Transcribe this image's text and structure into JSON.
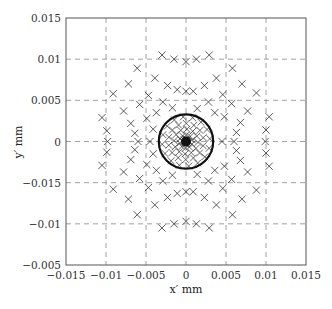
{
  "chart_data": {
    "type": "scatter",
    "title": "",
    "xlabel": "x′ mm",
    "ylabel": "y′ mm",
    "xlim": [
      -0.015,
      0.015
    ],
    "ylim": [
      -0.015,
      0.015
    ],
    "grid": true,
    "legend": null,
    "x_ticks": [
      "−0.015",
      "−0.01",
      "−0.005",
      "0",
      "0.005",
      "0.01",
      "0.015"
    ],
    "y_ticks_top_to_bottom": [
      "0.015",
      "0.01",
      "0.005",
      "0",
      "−0.015",
      "−0.01",
      "−0.005"
    ],
    "marker": "x",
    "colors": {
      "marker": "#333333",
      "grid": "#8a8a8a",
      "axes": "#555555",
      "circle": "#111111"
    },
    "circle": {
      "center": [
        0,
        0
      ],
      "radius": 0.0034,
      "label": ""
    },
    "series": [
      {
        "name": "spot diagram (outer rays, upper half)",
        "points": [
          [
            -0.003,
            0.0105
          ],
          [
            -0.0015,
            0.01
          ],
          [
            0.0,
            0.0097
          ],
          [
            -0.0061,
            0.0089
          ],
          [
            -0.0039,
            0.0077
          ],
          [
            -0.0072,
            0.007
          ],
          [
            -0.0023,
            0.0068
          ],
          [
            -0.0011,
            0.0063
          ],
          [
            0.0,
            0.0061
          ],
          [
            -0.0091,
            0.0058
          ],
          [
            -0.0047,
            0.0056
          ],
          [
            -0.0058,
            0.0045
          ],
          [
            -0.0029,
            0.0048
          ],
          [
            -0.0078,
            0.0037
          ],
          [
            -0.0037,
            0.0035
          ],
          [
            -0.0017,
            0.0041
          ],
          [
            -0.0105,
            0.0029
          ],
          [
            -0.0049,
            0.0028
          ],
          [
            -0.0069,
            0.0022
          ],
          [
            -0.0099,
            0.0013
          ],
          [
            -0.0041,
            0.0015
          ],
          [
            -0.0064,
            0.001
          ],
          [
            -0.0098,
            0.0
          ],
          [
            0.0029,
            0.0105
          ],
          [
            0.0013,
            0.01
          ],
          [
            0.0058,
            0.0089
          ],
          [
            0.0038,
            0.0077
          ],
          [
            0.007,
            0.007
          ],
          [
            0.0023,
            0.0068
          ],
          [
            0.0009,
            0.0061
          ],
          [
            0.0088,
            0.0059
          ],
          [
            0.0046,
            0.0057
          ],
          [
            0.0057,
            0.0046
          ],
          [
            0.0028,
            0.0048
          ],
          [
            0.0014,
            0.004
          ],
          [
            0.0077,
            0.0037
          ],
          [
            0.0036,
            0.0035
          ],
          [
            0.0104,
            0.003
          ],
          [
            0.0048,
            0.003
          ],
          [
            0.0068,
            0.0023
          ],
          [
            0.01,
            0.0014
          ],
          [
            0.0063,
            0.0011
          ],
          [
            0.0099,
            0.0
          ],
          [
            0.006,
            0.0
          ],
          [
            -0.006,
            0.0
          ],
          [
            -0.0045,
            0.0
          ],
          [
            0.0045,
            0.0
          ]
        ]
      },
      {
        "name": "spot diagram (outer rays, lower half)",
        "points": [
          [
            -0.003,
            -0.0105
          ],
          [
            -0.0015,
            -0.01
          ],
          [
            0.0,
            -0.0097
          ],
          [
            -0.0061,
            -0.0089
          ],
          [
            -0.0039,
            -0.0077
          ],
          [
            -0.0072,
            -0.007
          ],
          [
            -0.0023,
            -0.0068
          ],
          [
            -0.0011,
            -0.0063
          ],
          [
            0.0,
            -0.0061
          ],
          [
            -0.0091,
            -0.0058
          ],
          [
            -0.0047,
            -0.0056
          ],
          [
            -0.0058,
            -0.0045
          ],
          [
            -0.0029,
            -0.0048
          ],
          [
            -0.0078,
            -0.0037
          ],
          [
            -0.0037,
            -0.0035
          ],
          [
            -0.0017,
            -0.0041
          ],
          [
            -0.0105,
            -0.0029
          ],
          [
            -0.0049,
            -0.0028
          ],
          [
            -0.0069,
            -0.0022
          ],
          [
            -0.0099,
            -0.0013
          ],
          [
            -0.0041,
            -0.0015
          ],
          [
            -0.0064,
            -0.001
          ],
          [
            0.0029,
            -0.0105
          ],
          [
            0.0013,
            -0.01
          ],
          [
            0.0058,
            -0.0089
          ],
          [
            0.0038,
            -0.0077
          ],
          [
            0.007,
            -0.007
          ],
          [
            0.0023,
            -0.0068
          ],
          [
            0.0009,
            -0.0061
          ],
          [
            0.0088,
            -0.0059
          ],
          [
            0.0046,
            -0.0057
          ],
          [
            0.0057,
            -0.0046
          ],
          [
            0.0028,
            -0.0048
          ],
          [
            0.0014,
            -0.004
          ],
          [
            0.0077,
            -0.0037
          ],
          [
            0.0036,
            -0.0035
          ],
          [
            0.0104,
            -0.003
          ],
          [
            0.0048,
            -0.003
          ],
          [
            0.0068,
            -0.0023
          ],
          [
            0.01,
            -0.0014
          ],
          [
            0.0063,
            -0.0011
          ]
        ]
      },
      {
        "name": "spot diagram (inner dense core)",
        "rings": [
          {
            "radius": 0.003,
            "count": 16
          },
          {
            "radius": 0.0022,
            "count": 14
          },
          {
            "radius": 0.0015,
            "count": 12
          },
          {
            "radius": 0.0008,
            "count": 10
          },
          {
            "radius": 0.0003,
            "count": 8
          }
        ]
      }
    ]
  }
}
